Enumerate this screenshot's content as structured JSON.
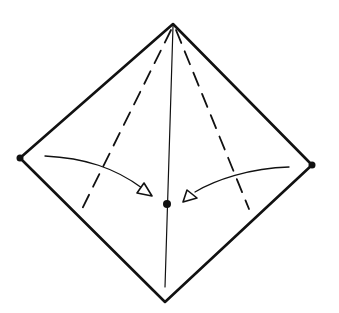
{
  "diagram": {
    "type": "origami-fold-step",
    "colors": {
      "background": "#ffffff",
      "ink": "#111111"
    },
    "points": {
      "top": [
        173,
        24
      ],
      "left": [
        20,
        158
      ],
      "right": [
        312,
        165
      ],
      "bottom": [
        165,
        302
      ],
      "center": [
        167,
        204
      ]
    },
    "elements": [
      "outline",
      "center-crease",
      "left-dashed-valley-fold",
      "right-dashed-valley-fold",
      "left-fold-arrow",
      "right-fold-arrow",
      "left-corner-dot",
      "right-corner-dot",
      "center-target-dot"
    ]
  }
}
